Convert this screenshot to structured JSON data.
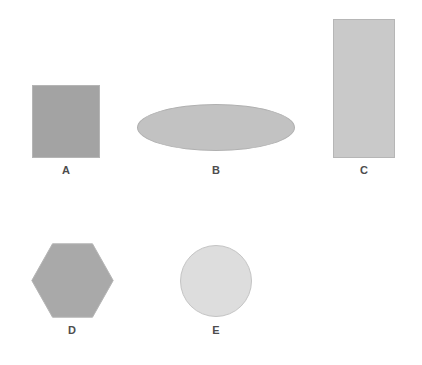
{
  "figure": {
    "width": 422,
    "height": 365,
    "background_color": "#ffffff"
  },
  "shapes": [
    {
      "id": "a",
      "label": "A",
      "kind": "square",
      "fill_color": "#a3a3a3",
      "stroke_color": "#b5b5b5",
      "x": 32,
      "y": 85,
      "width": 68,
      "height": 73
    },
    {
      "id": "b",
      "label": "B",
      "kind": "ellipse",
      "fill_color": "#c2c2c2",
      "stroke_color": "#b0b0b0",
      "x": 137,
      "y": 104,
      "width": 158,
      "height": 47
    },
    {
      "id": "c",
      "label": "C",
      "kind": "rectangle",
      "fill_color": "#c9c9c9",
      "stroke_color": "#b6b6b6",
      "x": 333,
      "y": 19,
      "width": 62,
      "height": 139
    },
    {
      "id": "d",
      "label": "D",
      "kind": "hexagon",
      "fill_color": "#a9a9a9",
      "stroke_color": "#b5b5b5",
      "x": 31,
      "y": 243,
      "width": 83,
      "height": 75
    },
    {
      "id": "e",
      "label": "E",
      "kind": "circle",
      "fill_color": "#dddddd",
      "stroke_color": "#c4c4c4",
      "x": 180,
      "y": 245,
      "width": 72,
      "height": 72
    }
  ],
  "label_style": {
    "color": "#4d4d4d",
    "font_size_px": 11,
    "font_weight": "bold"
  }
}
